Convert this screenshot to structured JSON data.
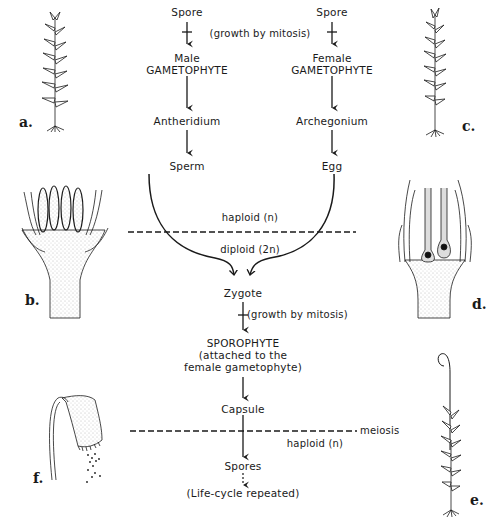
{
  "diagram": {
    "type": "moss life cycle",
    "left_column": {
      "spore": "Spore",
      "gametophyte_line1": "Male",
      "gametophyte_line2": "GAMETOPHYTE",
      "organ": "Antheridium",
      "gamete": "Sperm"
    },
    "right_column": {
      "spore": "Spore",
      "gametophyte_line1": "Female",
      "gametophyte_line2": "GAMETOPHYTE",
      "organ": "Archegonium",
      "gamete": "Egg"
    },
    "growth_note_top": "(growth by mitosis)",
    "haploid_label_top": "haploid (n)",
    "diploid_label": "diploid (2n)",
    "zygote": "Zygote",
    "growth_note_mid": "(growth by mitosis)",
    "sporophyte_line1": "SPOROPHYTE",
    "sporophyte_line2": "(attached to the",
    "sporophyte_line3": "female gametophyte)",
    "capsule": "Capsule",
    "meiosis_label": "meiosis",
    "haploid_label_bottom": "haploid (n)",
    "spores": "Spores",
    "repeat_note": "(Life-cycle repeated)"
  },
  "figures": {
    "a": "a.",
    "b": "b.",
    "c": "c.",
    "d": "d.",
    "e": "e.",
    "f": "f."
  },
  "figure_subjects": {
    "a": "male moss gametophyte plant",
    "b": "antheridia cluster section",
    "c": "female moss gametophyte plant",
    "d": "archegonia cluster section",
    "e": "sporophyte on female gametophyte",
    "f": "capsule releasing spores"
  },
  "colors": {
    "ink": "#1a1a1a",
    "background": "#ffffff",
    "stipple": "#888888"
  }
}
